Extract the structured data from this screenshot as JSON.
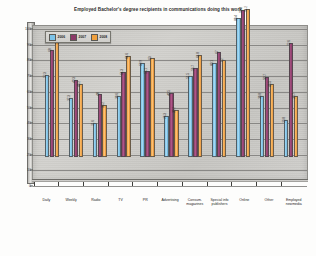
{
  "chart_data": {
    "type": "bar",
    "title": "Employed Bachelor's degree recipients in communications doing this work",
    "xlabel": "",
    "ylabel": "Percent",
    "ylim": [
      0,
      100
    ],
    "yticks": [
      0,
      10,
      20,
      30,
      40,
      50,
      60,
      70,
      80,
      90,
      100
    ],
    "grid": true,
    "legend_position": "top-left",
    "categories": [
      "Daily",
      "Weekly",
      "Radio",
      "TV",
      "PR",
      "Advertising",
      "Consum. magazines",
      "Special info publishers",
      "Online",
      "Other",
      "Employed newmedia"
    ],
    "series": [
      {
        "name": "2006",
        "color": "#7cc3e8",
        "values": [
          52.3,
          37.3,
          21.6,
          38.6,
          59.9,
          26.3,
          51.5,
          60.1,
          88.4,
          38.8,
          23.8
        ]
      },
      {
        "name": "2007",
        "color": "#8c3a68",
        "values": [
          68.0,
          49.3,
          40.0,
          54.3,
          55.1,
          40.5,
          56.7,
          67.0,
          93.5,
          50.7,
          72.6
        ]
      },
      {
        "name": "2008",
        "color": "#f0a03c",
        "values": [
          78.3,
          46.2,
          33.2,
          64.6,
          63.0,
          30.2,
          64.8,
          62.0,
          94.2,
          46.5,
          38.7
        ]
      }
    ]
  },
  "legend": {
    "items": [
      {
        "label": "2006",
        "color": "#7cc3e8"
      },
      {
        "label": "2007",
        "color": "#8c3a68"
      },
      {
        "label": "2008",
        "color": "#f0a03c"
      }
    ]
  }
}
